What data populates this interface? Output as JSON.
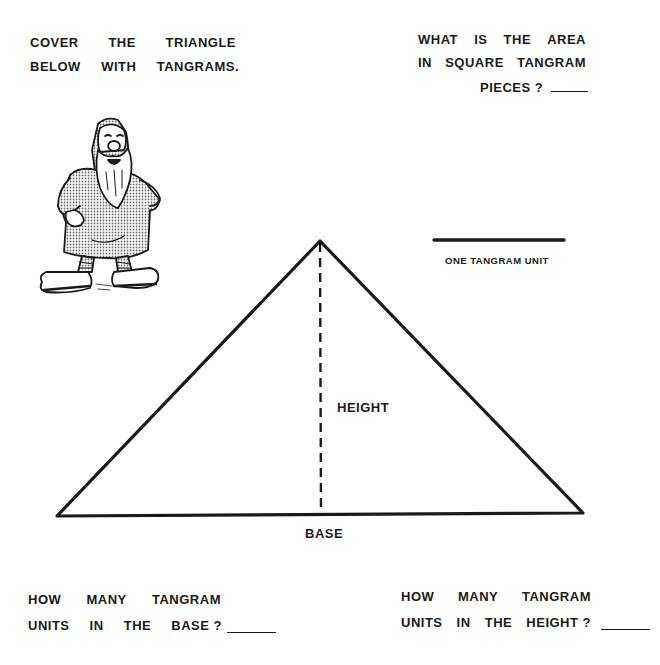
{
  "instructions": {
    "cover_line1": [
      "COVER",
      "THE",
      "TRIANGLE"
    ],
    "cover_line2": [
      "BELOW",
      "WITH",
      "TANGRAMS."
    ]
  },
  "area_question": {
    "line1": [
      "WHAT",
      "IS",
      "THE",
      "AREA"
    ],
    "line2": [
      "IN",
      "SQUARE",
      "TANGRAM"
    ],
    "line3": "PIECES ?",
    "answer": ""
  },
  "unit_legend": {
    "label": "ONE TANGRAM UNIT"
  },
  "triangle": {
    "height_label": "HEIGHT",
    "base_label": "BASE",
    "vertices": {
      "left": [
        57,
        516
      ],
      "apex": [
        320,
        241
      ],
      "right": [
        583,
        513
      ]
    }
  },
  "base_question": {
    "line1": [
      "HOW",
      "MANY",
      "TANGRAM"
    ],
    "line2": [
      "UNITS",
      "IN",
      "THE",
      "BASE ?"
    ],
    "answer": ""
  },
  "height_question": {
    "line1": [
      "HOW",
      "MANY",
      "TANGRAM"
    ],
    "line2": [
      "UNITS",
      "IN",
      "THE",
      "HEIGHT ?"
    ],
    "answer": ""
  },
  "illustration": {
    "subject": "bearded gnome in hooded robe and sandals"
  },
  "colors": {
    "ink": "#1a1a1a",
    "paper": "#ffffff",
    "shading": "#b8b8b8"
  }
}
